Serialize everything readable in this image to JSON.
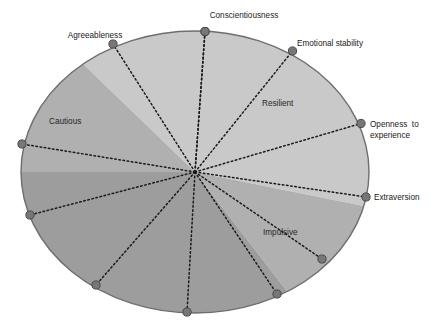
{
  "figure": {
    "name": "personality-trait-circumplex-wheel",
    "type": "radial-sector-diagram"
  },
  "colors": {
    "light_gray": "#c9c9c9",
    "mid_gray": "#b0b0b0",
    "dark_gray": "#9d9d9d",
    "outline": "#6e6e6e",
    "node": "#777777",
    "node_stroke": "#4a4a4a",
    "spoke": "#1a1a1a",
    "text": "#1a1a1a",
    "background": "#ffffff"
  },
  "geometry": {
    "center_x": 195,
    "center_y": 172,
    "radius_x": 174,
    "radius_y": 141,
    "spoke_count": 12
  },
  "outer_labels": [
    {
      "id": "conscientiousness",
      "text": "Conscientiousness",
      "x": 244,
      "y": 18,
      "anchor": "middle",
      "node_x": 205,
      "node_y": 31.5,
      "angle_deg": -86
    },
    {
      "id": "emotional-stability",
      "text": "Emotional stability",
      "x": 297,
      "y": 46,
      "anchor": "start",
      "node_x": 292.5,
      "node_y": 51,
      "angle_deg": -56
    },
    {
      "id": "openness-to-experience-line1",
      "text": "Openness  to",
      "x": 370,
      "y": 127,
      "anchor": "start",
      "node_x": 361,
      "node_y": 123.5,
      "angle_deg": -16
    },
    {
      "id": "openness-to-experience-line2",
      "text": "experience",
      "x": 370,
      "y": 138,
      "anchor": "start"
    },
    {
      "id": "extraversion",
      "text": "Extraversion",
      "x": 374,
      "y": 200,
      "anchor": "start",
      "node_x": 366,
      "node_y": 197,
      "angle_deg": 10
    },
    {
      "id": "agreeableness",
      "text": "Agreeableness",
      "x": 95,
      "y": 38,
      "anchor": "middle",
      "node_x": 113,
      "node_y": 44,
      "angle_deg": -120
    }
  ],
  "inner_labels": [
    {
      "id": "resilient",
      "text": "Resilient",
      "x": 262,
      "y": 106,
      "anchor": "start"
    },
    {
      "id": "cautious",
      "text": "Cautious",
      "x": 49,
      "y": 124,
      "anchor": "start"
    },
    {
      "id": "impulsive",
      "text": "Impulsive",
      "x": 263,
      "y": 235,
      "anchor": "start"
    }
  ],
  "nodes": [
    {
      "id": "node-conscientiousness",
      "x": 205,
      "y": 31.5,
      "labeled": true
    },
    {
      "id": "node-emotional-stability",
      "x": 292.5,
      "y": 51,
      "labeled": true
    },
    {
      "id": "node-openness-to-experience",
      "x": 361,
      "y": 123.5,
      "labeled": true
    },
    {
      "id": "node-extraversion",
      "x": 366,
      "y": 197,
      "labeled": true
    },
    {
      "id": "node-unlabeled-lower-right-1",
      "x": 322,
      "y": 259,
      "labeled": false
    },
    {
      "id": "node-unlabeled-lower-right-2",
      "x": 277,
      "y": 294,
      "labeled": false
    },
    {
      "id": "node-unlabeled-bottom",
      "x": 187,
      "y": 312,
      "labeled": false
    },
    {
      "id": "node-unlabeled-lower-left-1",
      "x": 96,
      "y": 285,
      "labeled": false
    },
    {
      "id": "node-unlabeled-lower-left-2",
      "x": 30,
      "y": 215,
      "labeled": false
    },
    {
      "id": "node-unlabeled-left",
      "x": 22,
      "y": 144,
      "labeled": false
    },
    {
      "id": "node-agreeableness",
      "x": 113,
      "y": 44,
      "labeled": true
    },
    {
      "id": "node-top-hidden",
      "x": 205,
      "y": 31.5,
      "labeled": false
    }
  ],
  "sectors": [
    {
      "id": "sector-light-upper",
      "shade": "light",
      "from_deg": -130,
      "to_deg": 14
    },
    {
      "id": "sector-mid-cautious",
      "shade": "mid",
      "from_deg": -180,
      "to_deg": -130
    },
    {
      "id": "sector-mid-impulsive",
      "shade": "mid",
      "from_deg": 14,
      "to_deg": 58
    },
    {
      "id": "sector-dark-lower",
      "shade": "dark",
      "from_deg": 58,
      "to_deg": 180
    }
  ]
}
